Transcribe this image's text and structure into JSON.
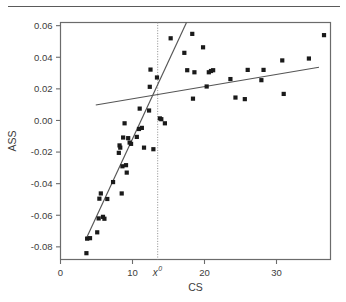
{
  "figure": {
    "separator_rule": "horizontal-rule-top",
    "background_color": "#ffffff",
    "frame_color": "#6b6b6b",
    "marker_color": "#1a1a1a",
    "line_color": "#555555",
    "reference_line_color": "#8a8a8a"
  },
  "chart_data": {
    "type": "scatter",
    "title": "",
    "subtitle": "",
    "xlabel": "CS",
    "ylabel": "ASS",
    "xlim": [
      0,
      37.5
    ],
    "ylim": [
      -0.088,
      0.062
    ],
    "xticks": [
      0,
      10,
      20,
      30
    ],
    "xtick_labels": [
      "0",
      "10",
      "20",
      "30"
    ],
    "yticks": [
      0.06,
      0.04,
      0.02,
      0.0,
      -0.02,
      -0.04,
      -0.06,
      -0.08
    ],
    "ytick_labels": [
      "0.06",
      "0.04",
      "0.02",
      "0.00",
      "-0.02",
      "-0.04",
      "-0.06",
      "-0.08"
    ],
    "grid": false,
    "legend": null,
    "legend_position": "none",
    "marker_style": "filled-square",
    "annotations": [
      {
        "name": "threshold-label",
        "text": "x",
        "superscript": "0",
        "x": 13.5,
        "y": -0.095,
        "italic": true
      }
    ],
    "reference_lines": [
      {
        "name": "threshold-vertical-line",
        "orientation": "vertical",
        "x": 13.5,
        "style": "dotted"
      }
    ],
    "fit_lines": [
      {
        "name": "steep-regression-below-threshold",
        "style": "solid",
        "x_start": 3.5,
        "y_start": -0.0755,
        "x_end": 17.5,
        "y_end": 0.062
      },
      {
        "name": "shallow-regression-above-threshold",
        "style": "solid",
        "x_start": 4.9,
        "y_start": 0.0098,
        "x_end": 35.9,
        "y_end": 0.0337
      }
    ],
    "points": [
      {
        "x": 3.6,
        "y": -0.084
      },
      {
        "x": 3.7,
        "y": -0.0748
      },
      {
        "x": 4.1,
        "y": -0.0745
      },
      {
        "x": 5.1,
        "y": -0.0708
      },
      {
        "x": 5.3,
        "y": -0.062
      },
      {
        "x": 5.4,
        "y": -0.0495
      },
      {
        "x": 5.6,
        "y": -0.0462
      },
      {
        "x": 5.9,
        "y": -0.061
      },
      {
        "x": 6.1,
        "y": -0.0622
      },
      {
        "x": 6.5,
        "y": -0.0497
      },
      {
        "x": 7.3,
        "y": -0.039
      },
      {
        "x": 8.1,
        "y": -0.0205
      },
      {
        "x": 8.2,
        "y": -0.0158
      },
      {
        "x": 8.3,
        "y": -0.0172
      },
      {
        "x": 8.5,
        "y": -0.0462
      },
      {
        "x": 8.6,
        "y": -0.029
      },
      {
        "x": 8.7,
        "y": -0.0108
      },
      {
        "x": 8.9,
        "y": -0.0018
      },
      {
        "x": 9.1,
        "y": -0.0283
      },
      {
        "x": 9.2,
        "y": -0.033
      },
      {
        "x": 9.4,
        "y": -0.0112
      },
      {
        "x": 9.6,
        "y": -0.014
      },
      {
        "x": 9.8,
        "y": -0.0148
      },
      {
        "x": 10.6,
        "y": -0.0104
      },
      {
        "x": 10.9,
        "y": -0.0054
      },
      {
        "x": 11.0,
        "y": 0.0075
      },
      {
        "x": 11.3,
        "y": -0.0047
      },
      {
        "x": 11.6,
        "y": -0.0172
      },
      {
        "x": 12.3,
        "y": 0.0063
      },
      {
        "x": 12.4,
        "y": 0.0213
      },
      {
        "x": 12.5,
        "y": 0.0322
      },
      {
        "x": 12.9,
        "y": -0.0182
      },
      {
        "x": 13.4,
        "y": 0.0272
      },
      {
        "x": 13.8,
        "y": 0.0013
      },
      {
        "x": 14.0,
        "y": 0.0008
      },
      {
        "x": 14.5,
        "y": -0.0018
      },
      {
        "x": 15.3,
        "y": 0.052
      },
      {
        "x": 17.2,
        "y": 0.0428
      },
      {
        "x": 17.6,
        "y": 0.0318
      },
      {
        "x": 18.3,
        "y": 0.0548
      },
      {
        "x": 18.4,
        "y": 0.0138
      },
      {
        "x": 18.6,
        "y": 0.0305
      },
      {
        "x": 19.8,
        "y": 0.0463
      },
      {
        "x": 20.3,
        "y": 0.0215
      },
      {
        "x": 20.6,
        "y": 0.0305
      },
      {
        "x": 20.9,
        "y": 0.0313
      },
      {
        "x": 21.2,
        "y": 0.0318
      },
      {
        "x": 23.6,
        "y": 0.0262
      },
      {
        "x": 24.3,
        "y": 0.0145
      },
      {
        "x": 25.6,
        "y": 0.0135
      },
      {
        "x": 26.0,
        "y": 0.032
      },
      {
        "x": 27.9,
        "y": 0.0255
      },
      {
        "x": 28.2,
        "y": 0.032
      },
      {
        "x": 30.8,
        "y": 0.038
      },
      {
        "x": 31.0,
        "y": 0.0168
      },
      {
        "x": 34.5,
        "y": 0.0392
      },
      {
        "x": 36.6,
        "y": 0.054
      }
    ]
  }
}
